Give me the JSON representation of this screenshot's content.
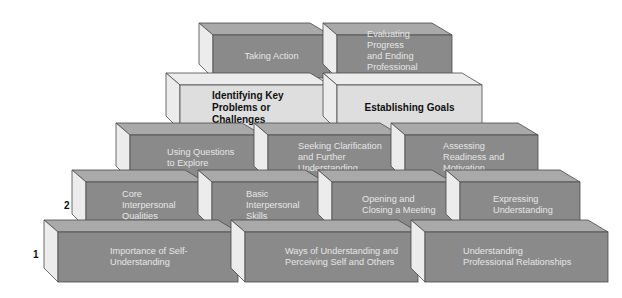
{
  "colors": {
    "front_dark": "#8a8a8a",
    "top_dark": "#a9a9a9",
    "side": "#ececec",
    "front_light": "#dedede",
    "top_light": "#ececec",
    "outline": "#4a4a4a",
    "text_dark_face": "#e6e6e6",
    "text_light_face": "#111111"
  },
  "levels": [
    {
      "number": "5",
      "number_pos": [
        201,
        51
      ],
      "style": "dark",
      "y": 35,
      "h": 43,
      "bricks": [
        {
          "label": "Taking Action",
          "x": 213,
          "w": 117,
          "align": "center"
        },
        {
          "label": "Evaluating Progress\nand Ending\nProfessional\nRelationships",
          "x": 337,
          "w": 115,
          "align": "left",
          "pad": 30
        }
      ]
    },
    {
      "number": "4",
      "number_pos": [
        168,
        100
      ],
      "style": "light",
      "y": 85,
      "h": 45,
      "bricks": [
        {
          "label": "Identifying Key\nProblems or Challenges",
          "x": 180,
          "w": 150,
          "align": "left",
          "pad": 32
        },
        {
          "label": "Establishing Goals",
          "x": 337,
          "w": 145,
          "align": "center"
        }
      ]
    },
    {
      "number": "3",
      "number_pos": [
        119,
        151
      ],
      "style": "dark",
      "y": 135,
      "h": 45,
      "bricks": [
        {
          "label": "Using Questions\nto Explore",
          "x": 130,
          "w": 132,
          "align": "left",
          "pad": 37
        },
        {
          "label": "Seeking Clarification\nand Further\nUnderstanding",
          "x": 268,
          "w": 132,
          "align": "left",
          "pad": 30
        },
        {
          "label": "Assessing\nReadiness and\nMotivation",
          "x": 405,
          "w": 133,
          "align": "left",
          "pad": 38
        }
      ]
    },
    {
      "number": "2",
      "number_pos": [
        64,
        200
      ],
      "style": "dark",
      "y": 182,
      "h": 46,
      "bricks": [
        {
          "label": "Core\nInterpersonal\nQualities",
          "x": 86,
          "w": 119,
          "align": "left",
          "pad": 36
        },
        {
          "label": "Basic\nInterpersonal\nSkills",
          "x": 212,
          "w": 113,
          "align": "left",
          "pad": 34
        },
        {
          "label": "Opening and\nClosing a Meeting",
          "x": 332,
          "w": 120,
          "align": "left",
          "pad": 30
        },
        {
          "label": "Expressing\nUnderstanding",
          "x": 460,
          "w": 120,
          "align": "left",
          "pad": 33
        }
      ]
    },
    {
      "number": "1",
      "number_pos": [
        33,
        249
      ],
      "style": "dark",
      "y": 232,
      "h": 50,
      "bricks": [
        {
          "label": "Importance of Self-\nUnderstanding",
          "x": 58,
          "w": 180,
          "align": "left",
          "pad": 52
        },
        {
          "label": "Ways of Understanding and\nPerceiving Self and Others",
          "x": 245,
          "w": 173,
          "align": "left",
          "pad": 40
        },
        {
          "label": "Understanding\nProfessional Relationships",
          "x": 425,
          "w": 183,
          "align": "left",
          "pad": 38
        }
      ]
    }
  ]
}
